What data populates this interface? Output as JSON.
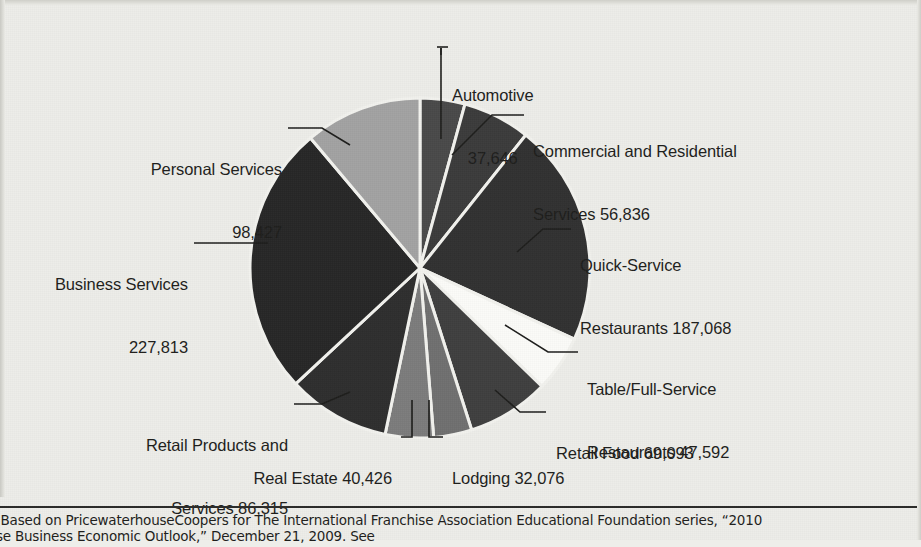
{
  "figure": {
    "background_color": "#edede9",
    "text_color": "#1d1d1b"
  },
  "chart_data": {
    "type": "pie",
    "title": "",
    "total": 883292,
    "units": "establishments",
    "start_angle_deg": 0,
    "direction": "clockwise",
    "center": {
      "x": 420,
      "y": 268
    },
    "radius": 170,
    "slice_gap_color": "#f2f2ee",
    "categories": [
      "Automotive",
      "Commercial and Residential Services",
      "Quick-Service Restaurants",
      "Table/Full-Service Restaurants",
      "Retail Food",
      "Lodging",
      "Real Estate",
      "Retail Products and Services",
      "Business Services",
      "Personal Services"
    ],
    "values": [
      37646,
      56836,
      187068,
      47592,
      69093,
      32076,
      40426,
      86315,
      227813,
      98427
    ],
    "value_labels": [
      "37,646",
      "56,836",
      "187,068",
      "47,592",
      "69,093",
      "32,076",
      "40,426",
      "86,315",
      "227,813",
      "98,427"
    ],
    "colors": [
      "#494949",
      "#3b3b3b",
      "#313131",
      "#fbfbf8",
      "#3f3f3f",
      "#6f6f6f",
      "#7b7b7b",
      "#2e2e2e",
      "#262626",
      "#a2a2a2"
    ],
    "legend": "none",
    "grid": false
  },
  "labels": {
    "automotive": {
      "name": "Automotive",
      "value": "37,646"
    },
    "commercial_residential": {
      "line1": "Commercial and Residential",
      "line2": "Services 56,836"
    },
    "quick_service": {
      "line1": "Quick-Service",
      "line2": "Restaurants 187,068"
    },
    "table_full_service": {
      "line1": "Table/Full-Service",
      "line2": "Restaurants 47,592"
    },
    "retail_food": {
      "text": "Retail Food 69,093"
    },
    "lodging": {
      "text": "Lodging 32,076"
    },
    "real_estate": {
      "text": "Real Estate 40,426"
    },
    "retail_products": {
      "line1": "Retail Products and",
      "line2": "Services 86,315"
    },
    "business_services": {
      "line1": "Business Services",
      "line2": "227,813"
    },
    "personal_services": {
      "line1": "Personal Services",
      "line2": "98,427"
    }
  },
  "footnote": {
    "prefix_italic": "e:",
    "line1": " Based on PricewaterhouseCoopers for The International Franchise Association Educational Foundation series, “2010",
    "line2": "hise Business Economic Outlook,” December 21, 2009. See"
  }
}
